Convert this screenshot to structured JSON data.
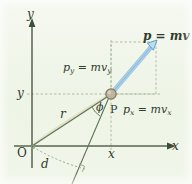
{
  "figure": {
    "kind": "physics-vector-diagram",
    "background_color": "#f1f6ea",
    "axis_color": "#5a6b55",
    "construction_line_color": "#6f8566",
    "dashed_guide_color": "#8fa386",
    "vector_fill_color": "#a9d2ef",
    "vector_stroke_color": "#3d7fb5",
    "particle_fill_color": "#b4ac93",
    "particle_stroke_color": "#7d7660",
    "text_color": "#2f3b2c"
  },
  "axes": {
    "y_label": "y",
    "x_label": "x",
    "origin_label": "O"
  },
  "ticks": {
    "y_value_label": "y",
    "x_value_label": "x"
  },
  "annotations": {
    "point_label": "P",
    "radius_label": "r",
    "angle_label": "ϕ",
    "moment_arm_label": "d"
  },
  "vectors": {
    "momentum": {
      "symbol": "p",
      "equals": "=",
      "expression": "mv",
      "full_label": "p = mv"
    },
    "momentum_y": {
      "symbol": "p",
      "symbol_sub": "y",
      "equals": "=",
      "expression": "mv",
      "expression_sub": "y",
      "full_label": "p_y = mv_y"
    },
    "momentum_x": {
      "symbol": "p",
      "symbol_sub": "x",
      "equals": "=",
      "expression": "mv",
      "expression_sub": "x",
      "full_label": "p_x = mv_x"
    }
  },
  "geometry": {
    "origin_px": [
      32,
      146
    ],
    "particle_px": [
      111,
      94
    ],
    "vector_tip_px": [
      156,
      42
    ],
    "x_axis_end_px": [
      176,
      146
    ],
    "y_axis_top_px": [
      32,
      22
    ]
  }
}
